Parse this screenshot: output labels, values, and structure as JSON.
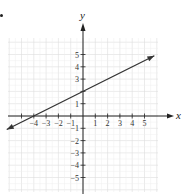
{
  "chart_data": {
    "type": "line",
    "title": "",
    "xlabel": "x",
    "ylabel": "y",
    "xlim": [
      -6,
      6
    ],
    "ylim": [
      -6,
      6
    ],
    "grid": true,
    "x_ticks": [
      -5,
      -4,
      -3,
      -2,
      -1,
      1,
      2,
      3,
      4,
      5
    ],
    "x_tick_labels": [
      "-4",
      "-3",
      "-2",
      "-1",
      "1",
      "2",
      "3",
      "4",
      "5"
    ],
    "y_ticks": [
      -5,
      -4,
      -3,
      -2,
      -1,
      1,
      2,
      3,
      4,
      5
    ],
    "y_tick_labels": [
      "5",
      "4",
      "3",
      "1",
      "-1",
      "-2",
      "-3",
      "-4",
      "-5"
    ],
    "series": [
      {
        "name": "line",
        "equation": "y = 0.5x + 2",
        "slope": 0.5,
        "intercept": 2,
        "x": [
          -6.2,
          -4,
          0,
          5.8
        ],
        "y": [
          -1.1,
          0,
          2,
          4.9
        ],
        "arrows": "both"
      }
    ],
    "key_points": [
      {
        "label": "x-intercept",
        "x": -4,
        "y": 0
      },
      {
        "label": "y-intercept",
        "x": 0,
        "y": 2
      }
    ]
  },
  "axes": {
    "x_label": "x",
    "y_label": "y"
  },
  "colors": {
    "grid": "#dddddd",
    "axis": "#222222",
    "line": "#333333"
  }
}
